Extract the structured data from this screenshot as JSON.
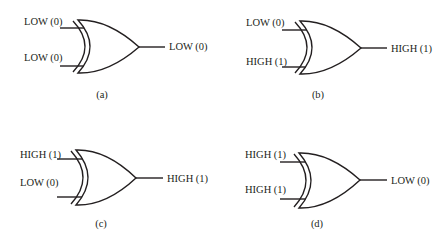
{
  "figure": {
    "gate_type": "XOR",
    "panels": [
      {
        "id": "a",
        "caption": "(a)",
        "input_a": "LOW (0)",
        "input_b": "LOW (0)",
        "output": "LOW (0)",
        "geom": {
          "x0": 60,
          "yA": 28,
          "yB": 66,
          "top": 20,
          "bot": 73,
          "backX": 78,
          "tipX": 139,
          "tipY": 47,
          "outEnd": 165,
          "capX": 102,
          "capY": 98,
          "lblLeft": 24,
          "lblAY": 25,
          "lblBY": 61,
          "outLblX": 169,
          "outLblY": 50
        }
      },
      {
        "id": "b",
        "caption": "(b)",
        "input_a": "LOW (0)",
        "input_b": "HIGH (1)",
        "output": "HIGH (1)",
        "geom": {
          "x0": 282,
          "yA": 30,
          "yB": 67,
          "top": 21,
          "bot": 74,
          "backX": 300,
          "tipX": 361,
          "tipY": 48,
          "outEnd": 387,
          "capX": 318,
          "capY": 98,
          "lblLeft": 246,
          "lblAY": 26,
          "lblBY": 65,
          "outLblX": 391,
          "outLblY": 52
        }
      },
      {
        "id": "c",
        "caption": "(c)",
        "input_a": "HIGH (1)",
        "input_b": "LOW (0)",
        "output": "HIGH (1)",
        "geom": {
          "x0": 57,
          "yA": 159,
          "yB": 197,
          "top": 150,
          "bot": 205,
          "backX": 76,
          "tipX": 136,
          "tipY": 178,
          "outEnd": 163,
          "capX": 101,
          "capY": 227,
          "lblLeft": 20,
          "lblAY": 158,
          "lblBY": 186,
          "outLblX": 167,
          "outLblY": 182
        }
      },
      {
        "id": "d",
        "caption": "(d)",
        "input_a": "HIGH (1)",
        "input_b": "HIGH (1)",
        "output": "LOW (0)",
        "geom": {
          "x0": 280,
          "yA": 162,
          "yB": 199,
          "top": 153,
          "bot": 208,
          "backX": 299,
          "tipX": 360,
          "tipY": 180,
          "outEnd": 387,
          "capX": 317,
          "capY": 227,
          "lblLeft": 245,
          "lblAY": 158,
          "lblBY": 193,
          "outLblX": 391,
          "outLblY": 184
        }
      }
    ]
  }
}
